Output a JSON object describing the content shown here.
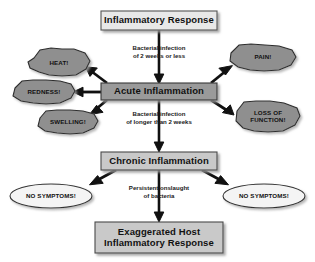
{
  "diagram": {
    "background_color": "#ffffff",
    "boxes": [
      {
        "id": "inflammatory-response",
        "label": "Inflammatory Response",
        "fill": "#e8e8e8",
        "stroke": "#555555",
        "x": 101,
        "y": 11,
        "w": 116,
        "h": 19
      },
      {
        "id": "acute-inflammation",
        "label": "Acute Inflammation",
        "fill": "#9a9a9a",
        "stroke": "#3a3a3a",
        "x": 101,
        "y": 83,
        "w": 116,
        "h": 17
      },
      {
        "id": "chronic-inflammation",
        "label": "Chronic Inflammation",
        "fill": "#c9c9c9",
        "stroke": "#4a4a4a",
        "x": 101,
        "y": 152,
        "w": 116,
        "h": 18
      },
      {
        "id": "exaggerated-host-inflammatory-response",
        "label": "Exaggerated Host\nInflammatory Response",
        "label_line1": "Exaggerated Host",
        "label_line2": "Inflammatory Response",
        "fill": "#c9c9c9",
        "stroke": "#4a4a4a",
        "x": 95,
        "y": 222,
        "w": 128,
        "h": 31
      }
    ],
    "clouds": [
      {
        "id": "heat",
        "label": "HEAT!",
        "label_line1": "HEAT!",
        "label_line2": "",
        "fill": "#8f8f8f",
        "stroke": "#2e2e2e",
        "cx": 59,
        "cy": 62,
        "rx": 31,
        "ry": 13
      },
      {
        "id": "redness",
        "label": "REDNESS!",
        "label_line1": "REDNESS!",
        "label_line2": "",
        "fill": "#8f8f8f",
        "stroke": "#2e2e2e",
        "cx": 44,
        "cy": 92,
        "rx": 31,
        "ry": 12
      },
      {
        "id": "swelling",
        "label": "SWELLING!",
        "label_line1": "SWELLING!",
        "label_line2": "",
        "fill": "#8f8f8f",
        "stroke": "#2e2e2e",
        "cx": 68,
        "cy": 122,
        "rx": 30,
        "ry": 12
      },
      {
        "id": "pain",
        "label": "PAIN!",
        "label_line1": "PAIN!",
        "label_line2": "",
        "fill": "#8f8f8f",
        "stroke": "#2e2e2e",
        "cx": 263,
        "cy": 57,
        "rx": 33,
        "ry": 13
      },
      {
        "id": "loss-of-function",
        "label": "LOSS OF FUNCTION!",
        "label_line1": "LOSS OF",
        "label_line2": "FUNCTION!",
        "fill": "#8f8f8f",
        "stroke": "#2e2e2e",
        "cx": 268,
        "cy": 116,
        "rx": 32,
        "ry": 15
      }
    ],
    "ellipses": [
      {
        "id": "no-symptoms-left",
        "label": "NO SYMPTOMS!",
        "fill": "#f4f4f4",
        "stroke": "#333333",
        "cx": 51,
        "cy": 196,
        "rx": 41,
        "ry": 12
      },
      {
        "id": "no-symptoms-right",
        "label": "NO SYMPTOMS!",
        "fill": "#f4f4f4",
        "stroke": "#333333",
        "cx": 264,
        "cy": 196,
        "rx": 41,
        "ry": 12
      }
    ],
    "edge_labels": [
      {
        "id": "bacterial-infection-short",
        "line1": "Bacterial infection",
        "line2": "of 2 weeks or less",
        "x": 119,
        "y": 44,
        "w": 80
      },
      {
        "id": "bacterial-infection-long",
        "line1": "Bacterial infection",
        "line2": "of longer than 2 weeks",
        "x": 113,
        "y": 110,
        "w": 92
      },
      {
        "id": "persistent-onslaught",
        "line1": "Persistent onslaught",
        "line2": "of bacteria",
        "x": 113,
        "y": 184,
        "w": 92
      }
    ],
    "arrows": [
      {
        "id": "arrow-response-to-acute",
        "from": "inflammatory-response",
        "to": "acute-inflammation"
      },
      {
        "id": "arrow-acute-to-heat",
        "from": "acute-inflammation",
        "to": "heat"
      },
      {
        "id": "arrow-acute-to-redness",
        "from": "acute-inflammation",
        "to": "redness"
      },
      {
        "id": "arrow-acute-to-swelling",
        "from": "acute-inflammation",
        "to": "swelling"
      },
      {
        "id": "arrow-acute-to-pain",
        "from": "acute-inflammation",
        "to": "pain"
      },
      {
        "id": "arrow-acute-to-loss",
        "from": "acute-inflammation",
        "to": "loss-of-function"
      },
      {
        "id": "arrow-acute-to-chronic",
        "from": "acute-inflammation",
        "to": "chronic-inflammation"
      },
      {
        "id": "arrow-chronic-to-left",
        "from": "chronic-inflammation",
        "to": "no-symptoms-left"
      },
      {
        "id": "arrow-chronic-to-right",
        "from": "chronic-inflammation",
        "to": "no-symptoms-right"
      },
      {
        "id": "arrow-chronic-to-exaggerated",
        "from": "chronic-inflammation",
        "to": "exaggerated-host-inflammatory-response"
      }
    ]
  }
}
